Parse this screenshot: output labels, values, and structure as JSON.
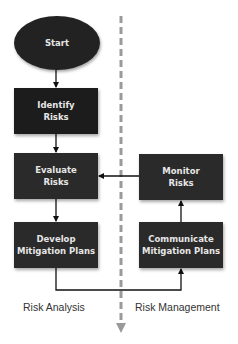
{
  "diagram": {
    "type": "flowchart",
    "nodes": {
      "start": {
        "label_line1": "Start",
        "shape": "ellipse"
      },
      "identify": {
        "label_line1": "Identify",
        "label_line2": "Risks",
        "shape": "rectangle"
      },
      "evaluate": {
        "label_line1": "Evaluate",
        "label_line2": "Risks",
        "shape": "rectangle"
      },
      "develop": {
        "label_line1": "Develop",
        "label_line2": "Mitigation Plans",
        "shape": "rectangle"
      },
      "monitor": {
        "label_line1": "Monitor",
        "label_line2": "Risks",
        "shape": "rectangle"
      },
      "communicate": {
        "label_line1": "Communicate",
        "label_line2": "Mitigation Plans",
        "shape": "rectangle"
      }
    },
    "edges": [
      {
        "from": "start",
        "to": "identify"
      },
      {
        "from": "identify",
        "to": "evaluate"
      },
      {
        "from": "evaluate",
        "to": "develop"
      },
      {
        "from": "develop",
        "to": "communicate"
      },
      {
        "from": "communicate",
        "to": "monitor"
      },
      {
        "from": "monitor",
        "to": "evaluate"
      }
    ],
    "lanes": {
      "left": "Risk Analysis",
      "right": "Risk Management"
    },
    "colors": {
      "node_fill": "#2a2a2a",
      "node_text": "#e6e6e6",
      "connector": "#111111",
      "divider": "#9a9a9a",
      "lane_label": "#333333"
    }
  }
}
